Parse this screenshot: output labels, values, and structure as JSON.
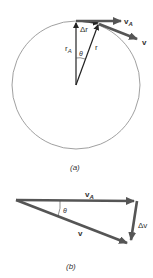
{
  "diagram_a": {
    "caption": "(a)",
    "labels": {
      "v_A": "v",
      "v_A_sub": "A",
      "v": "v",
      "r_A": "r",
      "r_A_sub": "A",
      "r": "r",
      "delta_r": "Δr",
      "theta": "θ"
    },
    "circle": {
      "cx": 76,
      "cy": 85,
      "r": 64
    }
  },
  "diagram_b": {
    "caption": "(b)",
    "labels": {
      "v_A": "v",
      "v_A_sub": "A",
      "v": "v",
      "delta_v": "Δv",
      "theta": "θ"
    }
  },
  "colors": {
    "circle": "#888888",
    "thin_vector": "#222222",
    "thick_vector": "#555555",
    "text": "#333333"
  }
}
